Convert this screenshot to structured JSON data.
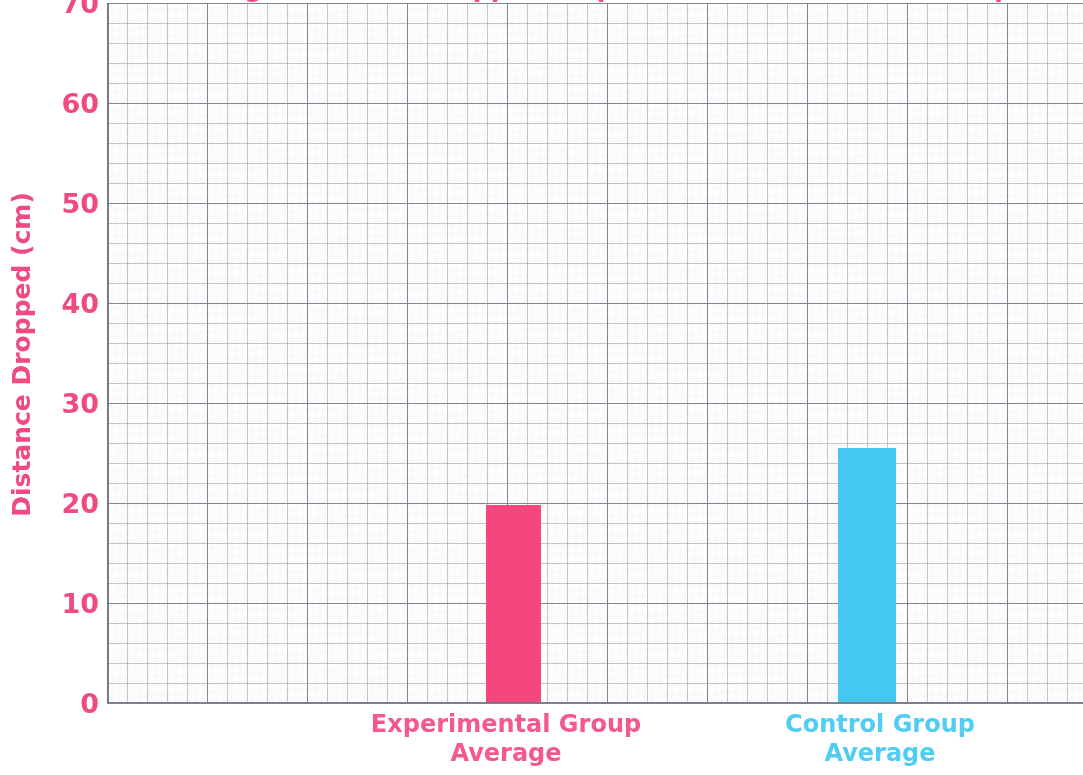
{
  "chart_data": {
    "type": "bar",
    "title": "Average Distance Dropped: Experimental vs. Control Groups",
    "xlabel": "",
    "ylabel": "Distance Dropped (cm)",
    "categories": [
      "Experimental Group Average",
      "Control Group Average"
    ],
    "values": [
      19.8,
      25.5
    ],
    "series": [
      {
        "name": "Average Distance Dropped",
        "values": [
          19.8,
          25.5
        ]
      }
    ],
    "bar_colors": [
      "#f5467d",
      "#45c8f0"
    ],
    "ylim": [
      0,
      70
    ],
    "y_ticks": [
      70,
      60,
      50,
      40,
      30,
      20,
      10,
      0
    ],
    "y_tick_labels": [
      "70",
      "60",
      "50",
      "40",
      "30",
      "20",
      "10",
      "0"
    ],
    "y_major_step": 10,
    "y_minor_step": 2,
    "grid": "on",
    "grid_style": "graph-paper",
    "legend": "none",
    "annotations": []
  },
  "axis": {
    "y_title": "Distance Dropped (cm)",
    "ticks": [
      {
        "label": "70",
        "value": 70
      },
      {
        "label": "60",
        "value": 60
      },
      {
        "label": "50",
        "value": 50
      },
      {
        "label": "40",
        "value": 40
      },
      {
        "label": "30",
        "value": 30
      },
      {
        "label": "20",
        "value": 20
      },
      {
        "label": "10",
        "value": 10
      },
      {
        "label": "0",
        "value": 0
      }
    ]
  },
  "bars": [
    {
      "id": "experimental",
      "label_line1": "Experimental Group",
      "label_line2": "Average",
      "value": 19.8,
      "color": "#f5467d"
    },
    {
      "id": "control",
      "label_line1": "Control Group",
      "label_line2": "Average",
      "value": 25.5,
      "color": "#45c8f0"
    }
  ],
  "colors": {
    "pink": "#ef4b7e",
    "bar_pink": "#f5467d",
    "label_pink": "#f5598b",
    "cyan": "#45c8f0",
    "label_cyan": "#4fcdf2",
    "grid_major": "#787e8a",
    "grid_minor": "#969ca6",
    "background": "#ffffff"
  },
  "title": {
    "text": "Average Distance Dropped: Experimental vs. Control Groups"
  }
}
